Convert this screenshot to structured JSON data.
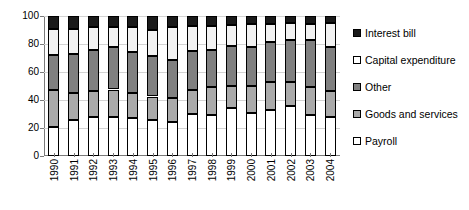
{
  "chart_data": {
    "type": "bar",
    "stacked": true,
    "title": "",
    "subtitle": "",
    "xlabel": "",
    "ylabel": "",
    "ylim": [
      0,
      100
    ],
    "yticks": [
      0,
      20,
      40,
      60,
      80,
      100
    ],
    "grid": true,
    "legend_position": "right",
    "categories": [
      "1990",
      "1991",
      "1992",
      "1993",
      "1994",
      "1995",
      "1996",
      "1997",
      "1998",
      "1999",
      "2000",
      "2001",
      "2002",
      "2003",
      "2004"
    ],
    "series": [
      {
        "name": "Payroll",
        "color": "#ffffff",
        "values": [
          21,
          25.5,
          28,
          28,
          27.5,
          25.5,
          24,
          30,
          29.5,
          34,
          30.5,
          33,
          35.5,
          29,
          28
        ]
      },
      {
        "name": "Goods and services",
        "color": "#aaaaaa",
        "values": [
          26,
          19.5,
          18.5,
          19.5,
          17.5,
          17,
          17.5,
          17.5,
          20,
          16,
          19.5,
          20,
          17.5,
          20,
          18.5
        ]
      },
      {
        "name": "Other",
        "color": "#808080",
        "values": [
          25,
          28,
          29,
          30.5,
          29.5,
          29,
          27,
          27.5,
          26,
          28.5,
          28,
          28.5,
          30,
          34,
          31.5
        ]
      },
      {
        "name": "Capital expenditure",
        "color": "#ffffff",
        "values": [
          19,
          18,
          16.5,
          14.5,
          17.5,
          18.5,
          24,
          18,
          17.5,
          15,
          16,
          12.5,
          12,
          11.5,
          17
        ]
      },
      {
        "name": "Interest bill",
        "color": "#1a1a1a",
        "values": [
          9,
          9,
          8,
          7.5,
          8,
          10,
          7.5,
          7,
          7,
          6.5,
          6,
          6,
          5,
          5.5,
          5
        ]
      }
    ],
    "cumulative_tops": [
      [
        21,
        47,
        72,
        91,
        100
      ],
      [
        25.5,
        45,
        73,
        91,
        100
      ],
      [
        28,
        46.5,
        75.5,
        92,
        100
      ],
      [
        28,
        47.5,
        78,
        92.5,
        100
      ],
      [
        27.5,
        45,
        74.5,
        92,
        100
      ],
      [
        25.5,
        42.5,
        71.5,
        90,
        100
      ],
      [
        24,
        41.5,
        68.5,
        92.5,
        100
      ],
      [
        30,
        47.5,
        75,
        93,
        100
      ],
      [
        29.5,
        49.5,
        75.5,
        93,
        100
      ],
      [
        34,
        50,
        78.5,
        93.5,
        100
      ],
      [
        30.5,
        50,
        78,
        94,
        100
      ],
      [
        33,
        53,
        81.5,
        94,
        100
      ],
      [
        35.5,
        53,
        83,
        95,
        100
      ],
      [
        29,
        49,
        83,
        94.5,
        100
      ],
      [
        28,
        46.5,
        78,
        95,
        100
      ]
    ]
  },
  "axis": {
    "y_tick_labels": [
      "0",
      "20",
      "40",
      "60",
      "80",
      "100"
    ]
  },
  "legend": {
    "items": [
      {
        "label": "Interest bill",
        "swatch": "sw-interest",
        "icon": "legend-swatch-black"
      },
      {
        "label": "Capital expenditure",
        "swatch": "sw-capital",
        "icon": "legend-swatch-white"
      },
      {
        "label": "Other",
        "swatch": "sw-other",
        "icon": "legend-swatch-dark-gray"
      },
      {
        "label": "Goods and services",
        "swatch": "sw-goods",
        "icon": "legend-swatch-light-gray"
      },
      {
        "label": "Payroll",
        "swatch": "sw-payroll",
        "icon": "legend-swatch-white"
      }
    ]
  }
}
